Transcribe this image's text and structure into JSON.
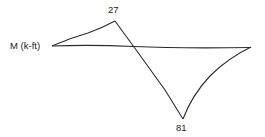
{
  "diagram": {
    "type": "bending-moment-diagram",
    "axis_label": "M (k-ft)",
    "peak_positive_label": "27",
    "peak_negative_label": "81",
    "line_color": "#2a2a2a",
    "points": {
      "left_support": [
        52,
        46
      ],
      "positive_peak": [
        115,
        21
      ],
      "zero_crossing": [
        134,
        47
      ],
      "negative_peak": [
        183,
        119
      ],
      "right_support": [
        251,
        47
      ]
    }
  }
}
